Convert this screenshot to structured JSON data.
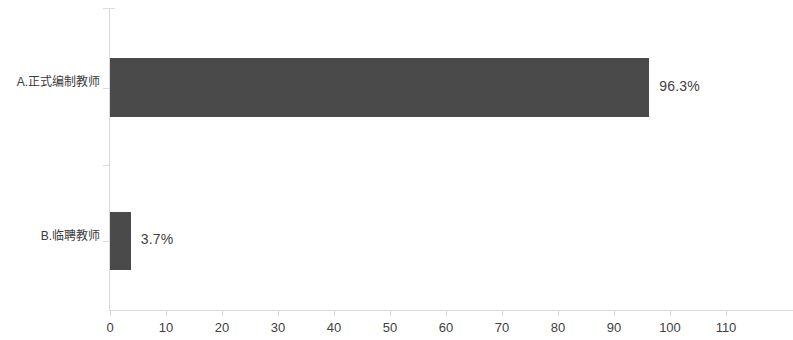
{
  "chart_data": {
    "type": "bar",
    "orientation": "horizontal",
    "title": "",
    "subtitle": "",
    "xlabel": "",
    "ylabel": "",
    "categories": [
      "A.正式编制教师",
      "B.临聘教师"
    ],
    "values": [
      96.3,
      3.7
    ],
    "data_labels": [
      "96.3%",
      "3.7%"
    ],
    "xlim": [
      0,
      110
    ],
    "xticks": [
      0,
      10,
      20,
      30,
      40,
      50,
      60,
      70,
      80,
      90,
      100,
      110
    ],
    "xtick_labels": [
      "0",
      "10",
      "20",
      "30",
      "40",
      "50",
      "60",
      "70",
      "80",
      "90",
      "100",
      "110"
    ],
    "grid": false,
    "legend": false,
    "legend_position": "none",
    "series": [
      {
        "name": "",
        "values": [
          96.3,
          3.7
        ]
      }
    ],
    "colors": {
      "bar": "#4a4a4a",
      "axis": "#d9d9d9",
      "text": "#3f3f3f",
      "background": "#ffffff"
    }
  }
}
